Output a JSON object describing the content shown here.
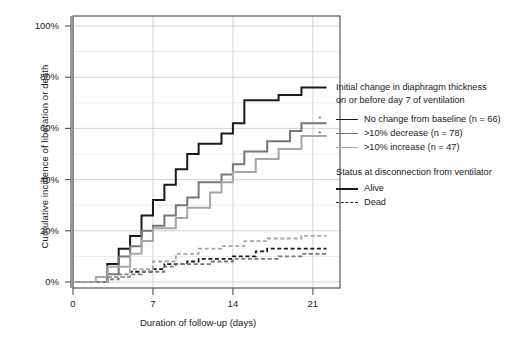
{
  "chart_data": {
    "type": "line",
    "subtype": "cumulative-incidence-step",
    "title": "",
    "xlabel": "Duration of follow-up (days)",
    "ylabel": "Cumulative incidence of liberation or death",
    "xlim": [
      0,
      22.5
    ],
    "ylim": [
      0,
      100
    ],
    "xticks": [
      0,
      7,
      14,
      21
    ],
    "xticklabels": [
      "0",
      "7",
      "14",
      "21"
    ],
    "yticks": [
      0,
      20,
      40,
      60,
      80,
      100
    ],
    "yticklabels": [
      "0%",
      "20%",
      "40%",
      "60%",
      "80%",
      "100%"
    ],
    "grid": true,
    "grid_axis": "both",
    "legend_position": "right",
    "annotations": [
      {
        "text": "*",
        "x": 21.6,
        "y": 63,
        "series": "no-change-dead-ref"
      },
      {
        "text": "*",
        "x": 21.6,
        "y": 57,
        "series": "decrease-alive-ref"
      }
    ],
    "series": [
      {
        "name": "No change from baseline (n = 66)",
        "status": "Alive",
        "color": "#1a1a1a",
        "dash": "solid",
        "width": 2.0,
        "points": [
          [
            0,
            0
          ],
          [
            3,
            0
          ],
          [
            3,
            7
          ],
          [
            4,
            7
          ],
          [
            4,
            13
          ],
          [
            5,
            13
          ],
          [
            5,
            18
          ],
          [
            6,
            18
          ],
          [
            6,
            26
          ],
          [
            7,
            26
          ],
          [
            7,
            32
          ],
          [
            8,
            32
          ],
          [
            8,
            38
          ],
          [
            9,
            38
          ],
          [
            9,
            44
          ],
          [
            10,
            44
          ],
          [
            10,
            50
          ],
          [
            11,
            50
          ],
          [
            11,
            54
          ],
          [
            13,
            54
          ],
          [
            13,
            58
          ],
          [
            14,
            58
          ],
          [
            14,
            62
          ],
          [
            15,
            62
          ],
          [
            15,
            71
          ],
          [
            18,
            71
          ],
          [
            18,
            73
          ],
          [
            20,
            73
          ],
          [
            20,
            76
          ],
          [
            22.2,
            76
          ]
        ]
      },
      {
        "name": ">10% decrease (n = 78)",
        "status": "Alive",
        "color": "#777777",
        "dash": "solid",
        "width": 2.0,
        "points": [
          [
            0,
            0
          ],
          [
            3,
            0
          ],
          [
            3,
            3
          ],
          [
            4,
            3
          ],
          [
            4,
            10
          ],
          [
            5,
            10
          ],
          [
            5,
            14
          ],
          [
            6,
            14
          ],
          [
            6,
            20
          ],
          [
            7,
            20
          ],
          [
            7,
            22
          ],
          [
            8,
            22
          ],
          [
            8,
            26
          ],
          [
            9,
            26
          ],
          [
            9,
            30
          ],
          [
            10,
            30
          ],
          [
            10,
            33
          ],
          [
            11,
            33
          ],
          [
            11,
            39
          ],
          [
            13,
            39
          ],
          [
            13,
            42
          ],
          [
            14,
            42
          ],
          [
            14,
            46
          ],
          [
            15,
            46
          ],
          [
            15,
            51
          ],
          [
            17,
            51
          ],
          [
            17,
            55
          ],
          [
            19,
            55
          ],
          [
            19,
            59
          ],
          [
            20,
            59
          ],
          [
            20,
            62
          ],
          [
            22.2,
            62
          ]
        ]
      },
      {
        "name": ">10% increase (n = 47)",
        "status": "Alive",
        "color": "#a6a6a6",
        "dash": "solid",
        "width": 2.0,
        "points": [
          [
            0,
            0
          ],
          [
            2,
            0
          ],
          [
            2,
            2
          ],
          [
            3,
            2
          ],
          [
            3,
            6
          ],
          [
            5,
            6
          ],
          [
            5,
            11
          ],
          [
            6,
            11
          ],
          [
            6,
            16
          ],
          [
            7,
            16
          ],
          [
            7,
            21
          ],
          [
            9,
            21
          ],
          [
            9,
            25
          ],
          [
            10,
            25
          ],
          [
            10,
            29
          ],
          [
            12,
            29
          ],
          [
            12,
            35
          ],
          [
            13,
            35
          ],
          [
            13,
            39
          ],
          [
            14,
            39
          ],
          [
            14,
            43
          ],
          [
            16,
            43
          ],
          [
            16,
            48
          ],
          [
            18,
            48
          ],
          [
            18,
            52
          ],
          [
            20,
            52
          ],
          [
            20,
            57
          ],
          [
            22.2,
            57
          ]
        ]
      },
      {
        "name": "No change from baseline (n = 66)",
        "status": "Dead",
        "color": "#1a1a1a",
        "dash": "dashed",
        "width": 1.8,
        "points": [
          [
            0,
            0
          ],
          [
            3,
            0
          ],
          [
            3,
            2
          ],
          [
            5,
            2
          ],
          [
            5,
            4
          ],
          [
            7,
            4
          ],
          [
            7,
            5
          ],
          [
            8,
            5
          ],
          [
            8,
            7
          ],
          [
            10,
            7
          ],
          [
            10,
            8
          ],
          [
            11,
            8
          ],
          [
            11,
            9
          ],
          [
            14,
            9
          ],
          [
            14,
            10
          ],
          [
            16,
            10
          ],
          [
            16,
            12
          ],
          [
            17,
            12
          ],
          [
            17,
            13
          ],
          [
            21,
            13
          ],
          [
            21,
            13
          ],
          [
            22.2,
            13
          ]
        ]
      },
      {
        "name": ">10% decrease (n = 78)",
        "status": "Dead",
        "color": "#777777",
        "dash": "dashed",
        "width": 1.8,
        "points": [
          [
            0,
            0
          ],
          [
            3,
            0
          ],
          [
            3,
            1
          ],
          [
            4,
            1
          ],
          [
            4,
            3
          ],
          [
            6,
            3
          ],
          [
            6,
            4
          ],
          [
            8,
            4
          ],
          [
            8,
            6
          ],
          [
            9,
            6
          ],
          [
            9,
            7
          ],
          [
            12,
            7
          ],
          [
            12,
            8
          ],
          [
            14,
            8
          ],
          [
            14,
            9
          ],
          [
            18,
            9
          ],
          [
            18,
            10
          ],
          [
            20,
            10
          ],
          [
            20,
            11
          ],
          [
            22.2,
            11
          ]
        ]
      },
      {
        "name": ">10% increase (n = 47)",
        "status": "Dead",
        "color": "#a6a6a6",
        "dash": "dashed",
        "width": 1.8,
        "points": [
          [
            0,
            0
          ],
          [
            3,
            0
          ],
          [
            3,
            2
          ],
          [
            5,
            2
          ],
          [
            5,
            5
          ],
          [
            7,
            5
          ],
          [
            7,
            8
          ],
          [
            9,
            8
          ],
          [
            9,
            11
          ],
          [
            11,
            11
          ],
          [
            11,
            13
          ],
          [
            13,
            13
          ],
          [
            13,
            14
          ],
          [
            15,
            14
          ],
          [
            15,
            16
          ],
          [
            17,
            16
          ],
          [
            17,
            17
          ],
          [
            20,
            17
          ],
          [
            20,
            18
          ],
          [
            22.2,
            18
          ]
        ]
      }
    ]
  },
  "axes": {
    "yticklabels": [
      "100%",
      "80%",
      "60%",
      "40%",
      "20%",
      "0%"
    ],
    "xticklabels": [
      "0",
      "7",
      "14",
      "21"
    ],
    "ylabel": "Cumulative incidence of liberation or death",
    "xlabel": "Duration of follow-up (days)"
  },
  "legend": {
    "group1": {
      "title_line1": "Initial change in diaphragm thickness",
      "title_line2": "on or before day 7 of ventilation",
      "items": [
        {
          "label": "No change from baseline (n = 66)",
          "color": "#1a1a1a",
          "dash": "solid"
        },
        {
          "label": ">10% decrease (n = 78)",
          "color": "#777777",
          "dash": "solid"
        },
        {
          "label": ">10% increase (n = 47)",
          "color": "#a6a6a6",
          "dash": "solid"
        }
      ]
    },
    "group2": {
      "title": "Status at disconnection from ventilator",
      "items": [
        {
          "label": "Alive",
          "color": "#1a1a1a",
          "dash": "solid"
        },
        {
          "label": "Dead",
          "color": "#222222",
          "dash": "dashed"
        }
      ]
    }
  },
  "caption": {
    "text": ""
  }
}
